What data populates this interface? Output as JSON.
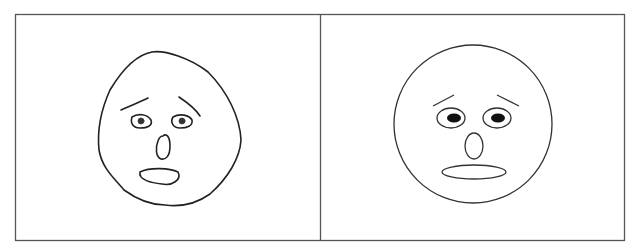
{
  "figure": {
    "panels": [
      {
        "id": "left",
        "label": "Hand-drawn worried face",
        "style": "hand-drawn",
        "features": [
          "irregular head outline",
          "raised worried eyebrows",
          "eyes with scribbled pupils",
          "oval nose",
          "open oval mouth"
        ]
      },
      {
        "id": "right",
        "label": "Schematic worried face",
        "style": "schematic",
        "features": [
          "circular head outline",
          "slanted eyebrows",
          "elliptical eyes with filled pupils",
          "oval nose",
          "flat elliptical mouth"
        ]
      }
    ],
    "colors": {
      "background": "#ffffff",
      "line": "#222222",
      "border": "#555555"
    }
  }
}
